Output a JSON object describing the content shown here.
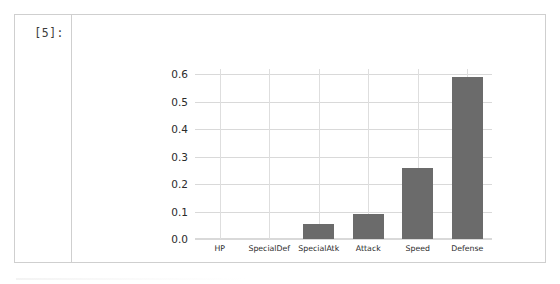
{
  "notebook": {
    "cell_prompt": "[5]:"
  },
  "chart_data": {
    "type": "bar",
    "title": "",
    "xlabel": "",
    "ylabel": "",
    "categories": [
      "HP",
      "SpecialDef",
      "SpecialAtk",
      "Attack",
      "Speed",
      "Defense"
    ],
    "values": [
      0.0,
      0.0,
      0.055,
      0.09,
      0.26,
      0.59
    ],
    "ylim": [
      0.0,
      0.62
    ],
    "yticks": [
      0.0,
      0.1,
      0.2,
      0.3,
      0.4,
      0.5,
      0.6
    ],
    "ytick_labels": [
      "0.0",
      "0.1",
      "0.2",
      "0.3",
      "0.4",
      "0.5",
      "0.6"
    ],
    "grid": true,
    "grid_axis": "both",
    "legend": false,
    "bar_color": "#6b6b6b",
    "grid_color": "#d9d9d9",
    "background": "#ffffff"
  }
}
